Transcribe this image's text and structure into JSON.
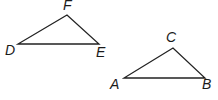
{
  "figure": {
    "type": "two triangles",
    "triangles": [
      {
        "name": "DEF",
        "vertices": {
          "D": {
            "label": "D",
            "x": 18,
            "y": 44,
            "label_x": 5,
            "label_y": 55
          },
          "E": {
            "label": "E",
            "x": 99,
            "y": 44,
            "label_x": 96,
            "label_y": 57
          },
          "F": {
            "label": "F",
            "x": 67,
            "y": 15,
            "label_x": 63,
            "label_y": 10
          }
        }
      },
      {
        "name": "ABC",
        "vertices": {
          "A": {
            "label": "A",
            "x": 124,
            "y": 78,
            "label_x": 110,
            "label_y": 89
          },
          "B": {
            "label": "B",
            "x": 205,
            "y": 78,
            "label_x": 202,
            "label_y": 89
          },
          "C": {
            "label": "C",
            "x": 173,
            "y": 48,
            "label_x": 166,
            "label_y": 42
          }
        }
      }
    ],
    "stroke_color": "#222222",
    "background": "#ffffff"
  }
}
